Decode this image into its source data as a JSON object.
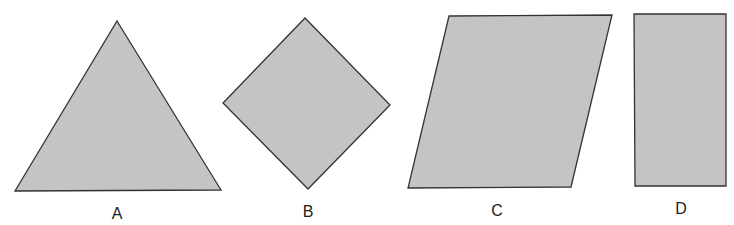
{
  "figure": {
    "fill_color": "#c4c4c4",
    "stroke_color": "#333333",
    "shapes": [
      {
        "label": "A",
        "type": "triangle",
        "points": "117,21 221,190 15,191",
        "label_pos": [
          117,
          219
        ]
      },
      {
        "label": "B",
        "type": "square-rotated",
        "points": "305,18 390,105 308,189 223,103",
        "label_pos": [
          308,
          217
        ]
      },
      {
        "label": "C",
        "type": "parallelogram",
        "points": "449,16 612,15 571,187 408,188",
        "label_pos": [
          497,
          216
        ]
      },
      {
        "label": "D",
        "type": "rectangle",
        "points": "634,14 726,14 726,186 635,186",
        "label_pos": [
          681,
          214
        ]
      }
    ]
  }
}
